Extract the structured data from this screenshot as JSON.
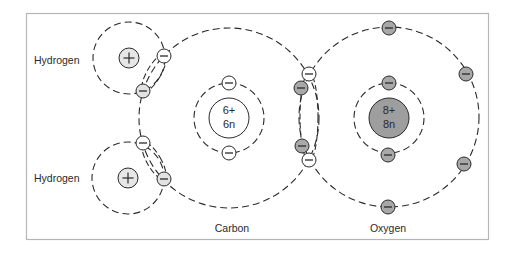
{
  "diagram": {
    "title": "",
    "colors": {
      "frame": "#b5b5b5",
      "line": "#2a2a2a",
      "hydrogen_electron_fill": "#e2e2e2",
      "carbon_electron_fill": "#ffffff",
      "oxygen_electron_fill": "#a8a8a8",
      "oxygen_nucleus_fill": "#9e9e9e",
      "hydrogen_proton_fill": "#e6e6e6",
      "carbon_nucleus_fill": "#ffffff"
    },
    "labels": {
      "hydrogen_top": "Hydrogen",
      "hydrogen_bottom": "Hydrogen",
      "carbon": "Carbon",
      "oxygen": "Oxygen"
    },
    "atoms": {
      "hydrogen_top": {
        "name": "Hydrogen",
        "nucleus_symbol": "+"
      },
      "hydrogen_bottom": {
        "name": "Hydrogen",
        "nucleus_symbol": "+"
      },
      "carbon": {
        "name": "Carbon",
        "protons": "6+",
        "neutrons": "6n"
      },
      "oxygen": {
        "name": "Oxygen",
        "protons": "8+",
        "neutrons": "8n"
      }
    },
    "electron_symbol": "−",
    "bonds": [
      {
        "between": [
          "Hydrogen",
          "Carbon"
        ],
        "type": "single covalent"
      },
      {
        "between": [
          "Hydrogen",
          "Carbon"
        ],
        "type": "single covalent"
      },
      {
        "between": [
          "Carbon",
          "Oxygen"
        ],
        "type": "double covalent"
      }
    ]
  }
}
